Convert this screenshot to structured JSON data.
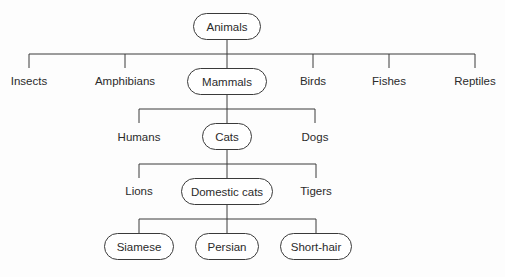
{
  "diagram": {
    "type": "hierarchy-tree",
    "root": {
      "label": "Animals",
      "children": [
        {
          "label": "Insects"
        },
        {
          "label": "Amphibians"
        },
        {
          "label": "Mammals",
          "children": [
            {
              "label": "Humans"
            },
            {
              "label": "Cats",
              "children": [
                {
                  "label": "Lions"
                },
                {
                  "label": "Domestic cats",
                  "children": [
                    {
                      "label": "Siamese"
                    },
                    {
                      "label": "Persian"
                    },
                    {
                      "label": "Short-hair"
                    }
                  ]
                },
                {
                  "label": "Tigers"
                }
              ]
            },
            {
              "label": "Dogs"
            }
          ]
        },
        {
          "label": "Birds"
        },
        {
          "label": "Fishes"
        },
        {
          "label": "Reptiles"
        }
      ]
    }
  },
  "nodes": {
    "animals": "Animals",
    "insects": "Insects",
    "amphibians": "Amphibians",
    "mammals": "Mammals",
    "birds": "Birds",
    "fishes": "Fishes",
    "reptiles": "Reptiles",
    "humans": "Humans",
    "cats": "Cats",
    "dogs": "Dogs",
    "lions": "Lions",
    "domestic_cats": "Domestic cats",
    "tigers": "Tigers",
    "siamese": "Siamese",
    "persian": "Persian",
    "short_hair": "Short-hair"
  },
  "colors": {
    "line": "#3a3a3a",
    "text": "#2b2b2b",
    "background": "#fdfdfd"
  }
}
